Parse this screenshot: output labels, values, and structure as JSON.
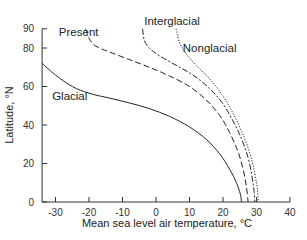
{
  "chart_data": {
    "type": "line",
    "title": "",
    "xlabel": "Mean sea level air temperature, °C",
    "ylabel": "Latitude, °N",
    "xlim": [
      -34,
      40
    ],
    "ylim": [
      0,
      90
    ],
    "x_ticks": [
      -30,
      -20,
      -10,
      0,
      10,
      20,
      30,
      40
    ],
    "y_ticks": [
      0,
      20,
      40,
      60,
      80,
      90
    ],
    "grid": false,
    "legend": "inline labels",
    "series": [
      {
        "name": "Glacial",
        "style": "solid",
        "label_pos": [
          -31,
          53
        ],
        "points": [
          [
            -34,
            72
          ],
          [
            -30,
            66
          ],
          [
            -25,
            60
          ],
          [
            -20,
            56.5
          ],
          [
            -14,
            54
          ],
          [
            -8,
            51.5
          ],
          [
            -2,
            48.5
          ],
          [
            4,
            44.5
          ],
          [
            10,
            39
          ],
          [
            15,
            32.5
          ],
          [
            19,
            25
          ],
          [
            22,
            17
          ],
          [
            24,
            10
          ],
          [
            25.2,
            4
          ],
          [
            25.5,
            0
          ]
        ]
      },
      {
        "name": "Present",
        "style": "dashed",
        "label_pos": [
          -29,
          86
        ],
        "points": [
          [
            -21,
            90
          ],
          [
            -20,
            85
          ],
          [
            -18,
            81
          ],
          [
            -14,
            78
          ],
          [
            -8,
            74
          ],
          [
            -2,
            70
          ],
          [
            4,
            65.5
          ],
          [
            10,
            60
          ],
          [
            15,
            53
          ],
          [
            19,
            45
          ],
          [
            22,
            36
          ],
          [
            24.5,
            26
          ],
          [
            26,
            17
          ],
          [
            27,
            8
          ],
          [
            27.5,
            0
          ]
        ]
      },
      {
        "name": "Interglacial",
        "style": "dash-dot",
        "label_pos": [
          -3.5,
          92
        ],
        "points": [
          [
            -4,
            90
          ],
          [
            -3.5,
            84
          ],
          [
            -2,
            80
          ],
          [
            1,
            76
          ],
          [
            6,
            71
          ],
          [
            11,
            66
          ],
          [
            16,
            59
          ],
          [
            20,
            51
          ],
          [
            23,
            42
          ],
          [
            25.5,
            33
          ],
          [
            27.5,
            23
          ],
          [
            28.7,
            13
          ],
          [
            29.3,
            5
          ],
          [
            29.5,
            0
          ]
        ]
      },
      {
        "name": "Nonglacial",
        "style": "dotted",
        "label_pos": [
          8,
          78
        ],
        "points": [
          [
            6,
            90
          ],
          [
            7,
            83
          ],
          [
            9,
            77
          ],
          [
            12,
            71
          ],
          [
            16,
            64
          ],
          [
            20,
            55
          ],
          [
            23,
            46
          ],
          [
            25.5,
            37
          ],
          [
            27.5,
            28
          ],
          [
            29,
            19
          ],
          [
            30,
            10
          ],
          [
            30.4,
            4
          ],
          [
            30.5,
            0
          ]
        ]
      }
    ]
  }
}
